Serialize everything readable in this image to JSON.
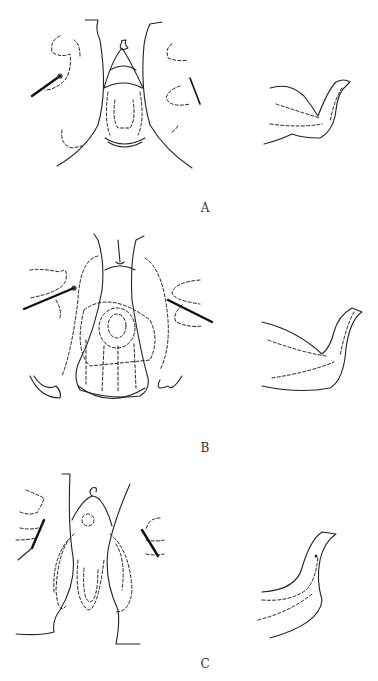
{
  "figure": {
    "panels": [
      {
        "id": "A",
        "label": "A",
        "description": "Frontal view with two needles/sutures and side profile view"
      },
      {
        "id": "B",
        "label": "B",
        "description": "Frontal view with dashed dissection outlines and side profile view"
      },
      {
        "id": "C",
        "label": "C",
        "description": "Frontal view with elongated dashed flaps and side profile view"
      }
    ],
    "line_color": "#222222",
    "background": "#ffffff"
  }
}
